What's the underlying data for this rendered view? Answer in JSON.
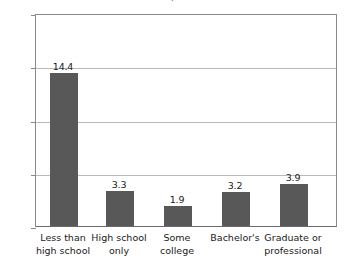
{
  "chart_data": {
    "type": "bar",
    "title": "",
    "xlabel": "",
    "ylabel": "Percent",
    "ylim": [
      0,
      20
    ],
    "yticks": [
      "0",
      "5",
      "10",
      "15",
      "20"
    ],
    "grid": true,
    "legend": "none",
    "categories": [
      "Less than high school",
      "High school only",
      "Some college",
      "Bachelor's",
      "Graduate or professional"
    ],
    "category_lines": [
      [
        "Less than",
        "high school"
      ],
      [
        "High school",
        "only"
      ],
      [
        "Some",
        "college"
      ],
      [
        "Bachelor's",
        ""
      ],
      [
        "Graduate or",
        "professional"
      ]
    ],
    "values": [
      14.4,
      3.3,
      1.9,
      3.2,
      3.9
    ],
    "value_labels": [
      "14.4",
      "3.3",
      "1.9",
      "3.2",
      "3.9"
    ],
    "bar_color": "#585858",
    "grid_color": "#b9b9b9",
    "axis_color": "#8a8a8a"
  },
  "title_fragment": "g"
}
